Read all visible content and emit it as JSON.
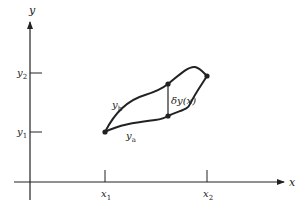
{
  "diagram": {
    "axes": {
      "x_label": "x",
      "y_label": "y"
    },
    "ticks": {
      "x1": {
        "main": "x",
        "sub": "1"
      },
      "x2": {
        "main": "x",
        "sub": "2"
      },
      "y1": {
        "main": "y",
        "sub": "1"
      },
      "y2": {
        "main": "y",
        "sub": "2"
      }
    },
    "curves": {
      "yb": {
        "main": "y",
        "sub": "b"
      },
      "ya": {
        "main": "y",
        "sub": "a"
      }
    },
    "variation_label": "δy(x)",
    "colors": {
      "stroke": "#222222",
      "background": "#ffffff"
    }
  }
}
